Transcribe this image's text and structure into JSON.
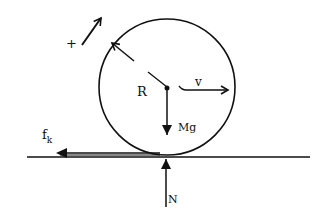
{
  "diagram": {
    "labels": {
      "plus": "+",
      "radius": "R",
      "velocity": "v",
      "weight": "Mg",
      "friction_main": "f",
      "friction_sub": "k",
      "normal": "N"
    },
    "colors": {
      "ink": "#111111",
      "background": "#ffffff"
    }
  }
}
